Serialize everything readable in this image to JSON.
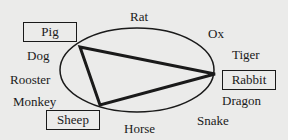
{
  "diagram": {
    "type": "chinese-zodiac-cycle",
    "highlighted": [
      "Pig",
      "Rabbit",
      "Sheep"
    ],
    "labels": {
      "rat": "Rat",
      "ox": "Ox",
      "tiger": "Tiger",
      "rabbit": "Rabbit",
      "dragon": "Dragon",
      "snake": "Snake",
      "horse": "Horse",
      "sheep": "Sheep",
      "monkey": "Monkey",
      "rooster": "Rooster",
      "dog": "Dog",
      "pig": "Pig"
    },
    "triangle_vertices": [
      "Pig",
      "Rabbit",
      "Sheep"
    ]
  }
}
